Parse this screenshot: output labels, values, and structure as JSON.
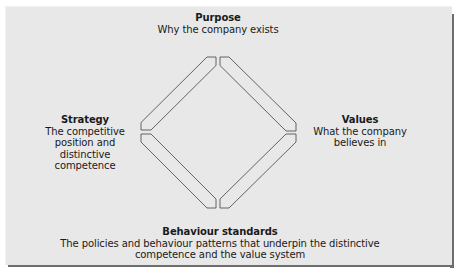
{
  "diagram": {
    "type": "four-element diamond model",
    "colors": {
      "panel_bg": "#e8e8e8",
      "shadow": "#6e6e6e",
      "stroke": "#555555",
      "text": "#1a1a1a"
    },
    "nodes": {
      "purpose": {
        "title": "Purpose",
        "desc": "Why the company exists",
        "position": "top"
      },
      "strategy": {
        "title": "Strategy",
        "desc": "The competitive position and distinctive competence",
        "position": "left"
      },
      "values": {
        "title": "Values",
        "desc": "What the company believes in",
        "position": "right"
      },
      "behaviour": {
        "title": "Behaviour standards",
        "desc": "The policies and behaviour patterns that underpin the distinctive competence and the value system",
        "position": "bottom"
      }
    },
    "connectors": [
      {
        "from": "strategy",
        "to": "purpose"
      },
      {
        "from": "purpose",
        "to": "values"
      },
      {
        "from": "values",
        "to": "behaviour"
      },
      {
        "from": "behaviour",
        "to": "strategy"
      }
    ]
  }
}
